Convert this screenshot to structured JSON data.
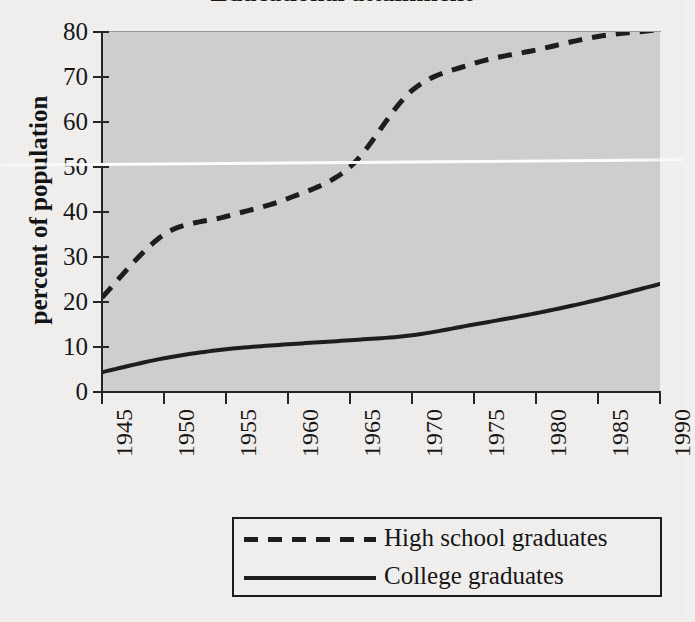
{
  "figure": {
    "title_fragment": "Educational attainment",
    "background_color": "#f1f0ee",
    "plot_background_color": "#cfcfcf",
    "line_color": "#1d1d1d"
  },
  "axes": {
    "y_axis_title": "percent of population",
    "y_ticks": [
      "0",
      "10",
      "20",
      "30",
      "40",
      "50",
      "60",
      "70",
      "80"
    ],
    "x_ticks": [
      "1945",
      "1950",
      "1955",
      "1960",
      "1965",
      "1970",
      "1975",
      "1980",
      "1985",
      "1990"
    ]
  },
  "legend": {
    "items": [
      {
        "label": "High school graduates",
        "style": "dashed"
      },
      {
        "label": "College graduates",
        "style": "solid"
      }
    ]
  },
  "chart_data": {
    "type": "line",
    "title": "Educational attainment",
    "xlabel": "",
    "ylabel": "percent of population",
    "xlim": [
      1945,
      1990
    ],
    "ylim": [
      0,
      80
    ],
    "grid": false,
    "legend_position": "bottom",
    "x": [
      1945,
      1950,
      1955,
      1960,
      1965,
      1970,
      1975,
      1980,
      1985,
      1990
    ],
    "series": [
      {
        "name": "High school graduates",
        "style": "dashed",
        "values": [
          21,
          35,
          39,
          43,
          50,
          67,
          73,
          76,
          79,
          80.5
        ]
      },
      {
        "name": "College graduates",
        "style": "solid",
        "values": [
          4.4,
          7.5,
          9.5,
          10.6,
          11.5,
          12.6,
          15.0,
          17.5,
          20.5,
          24.0
        ]
      }
    ]
  }
}
